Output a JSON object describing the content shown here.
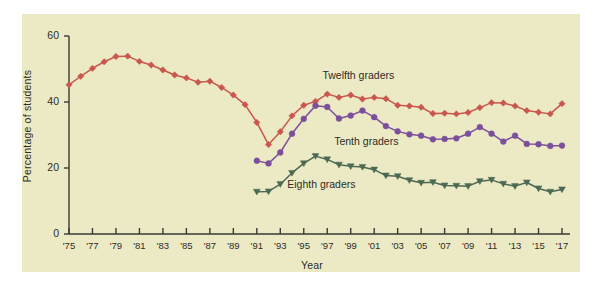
{
  "chart_data": {
    "type": "line",
    "title": "",
    "xlabel": "Year",
    "ylabel": "Percentage of students",
    "xlim": [
      1975,
      2017
    ],
    "ylim": [
      0,
      60
    ],
    "yticks": [
      0,
      20,
      40,
      60
    ],
    "ytick_labels": [
      "0",
      "20",
      "40",
      "60"
    ],
    "xticks": [
      1975,
      1977,
      1979,
      1981,
      1983,
      1985,
      1987,
      1989,
      1991,
      1993,
      1995,
      1997,
      1999,
      2001,
      2003,
      2005,
      2007,
      2009,
      2011,
      2013,
      2015,
      2017
    ],
    "xtick_labels": [
      "'75",
      "'77",
      "'79",
      "'81",
      "'83",
      "'85",
      "'87",
      "'89",
      "'91",
      "'93",
      "'95",
      "'97",
      "'99",
      "'01",
      "'03",
      "'05",
      "'07",
      "'09",
      "'11",
      "'13",
      "'15",
      "'17"
    ],
    "grid": false,
    "legend_position": "inline-annotations",
    "background_color": "#eceac4",
    "series": [
      {
        "name": "Twelfth graders",
        "color": "#c9574e",
        "marker": "diamond",
        "label_x": 2000,
        "label_y": 48,
        "x": [
          1975,
          1976,
          1977,
          1978,
          1979,
          1980,
          1981,
          1982,
          1983,
          1984,
          1985,
          1986,
          1987,
          1988,
          1989,
          1990,
          1991,
          1992,
          1993,
          1994,
          1995,
          1996,
          1997,
          1998,
          1999,
          2000,
          2001,
          2002,
          2003,
          2004,
          2005,
          2006,
          2007,
          2008,
          2009,
          2010,
          2011,
          2012,
          2013,
          2014,
          2015,
          2016,
          2017
        ],
        "y": [
          45.2,
          47.8,
          50.2,
          52.2,
          53.8,
          53.9,
          52.3,
          51.2,
          49.7,
          48.2,
          47.3,
          46.0,
          46.3,
          44.4,
          42.1,
          39.2,
          33.8,
          27.1,
          31.0,
          35.8,
          39.0,
          40.2,
          42.4,
          41.4,
          42.1,
          40.9,
          41.4,
          41.0,
          39.0,
          38.8,
          38.4,
          36.5,
          36.6,
          36.4,
          36.8,
          38.3,
          39.8,
          39.7,
          38.8,
          37.4,
          36.9,
          36.4,
          39.5
        ]
      },
      {
        "name": "Tenth graders",
        "color": "#7b4f9c",
        "marker": "circle",
        "label_x": 2001,
        "label_y": 28,
        "x": [
          1991,
          1992,
          1993,
          1994,
          1995,
          1996,
          1997,
          1998,
          1999,
          2000,
          2001,
          2002,
          2003,
          2004,
          2005,
          2006,
          2007,
          2008,
          2009,
          2010,
          2011,
          2012,
          2013,
          2014,
          2015,
          2016,
          2017
        ],
        "y": [
          22.2,
          21.4,
          24.7,
          30.4,
          34.9,
          38.9,
          38.5,
          35.0,
          35.9,
          37.4,
          35.4,
          32.7,
          31.1,
          30.2,
          29.8,
          28.7,
          28.8,
          29.0,
          30.4,
          32.4,
          30.4,
          28.0,
          29.8,
          27.3,
          27.2,
          26.7,
          26.8
        ]
      },
      {
        "name": "Eighth graders",
        "color": "#4c6a52",
        "marker": "triangle",
        "label_x": 1997,
        "label_y": 15,
        "x": [
          1991,
          1992,
          1993,
          1994,
          1995,
          1996,
          1997,
          1998,
          1999,
          2000,
          2001,
          2002,
          2003,
          2004,
          2005,
          2006,
          2007,
          2008,
          2009,
          2010,
          2011,
          2012,
          2013,
          2014,
          2015,
          2016,
          2017
        ],
        "y": [
          12.8,
          12.9,
          15.1,
          18.5,
          21.4,
          23.6,
          22.6,
          21.0,
          20.5,
          20.3,
          19.5,
          17.7,
          17.5,
          16.3,
          15.5,
          15.7,
          14.7,
          14.6,
          14.5,
          16.0,
          16.4,
          15.2,
          14.5,
          15.6,
          13.8,
          12.8,
          13.5
        ]
      }
    ]
  }
}
